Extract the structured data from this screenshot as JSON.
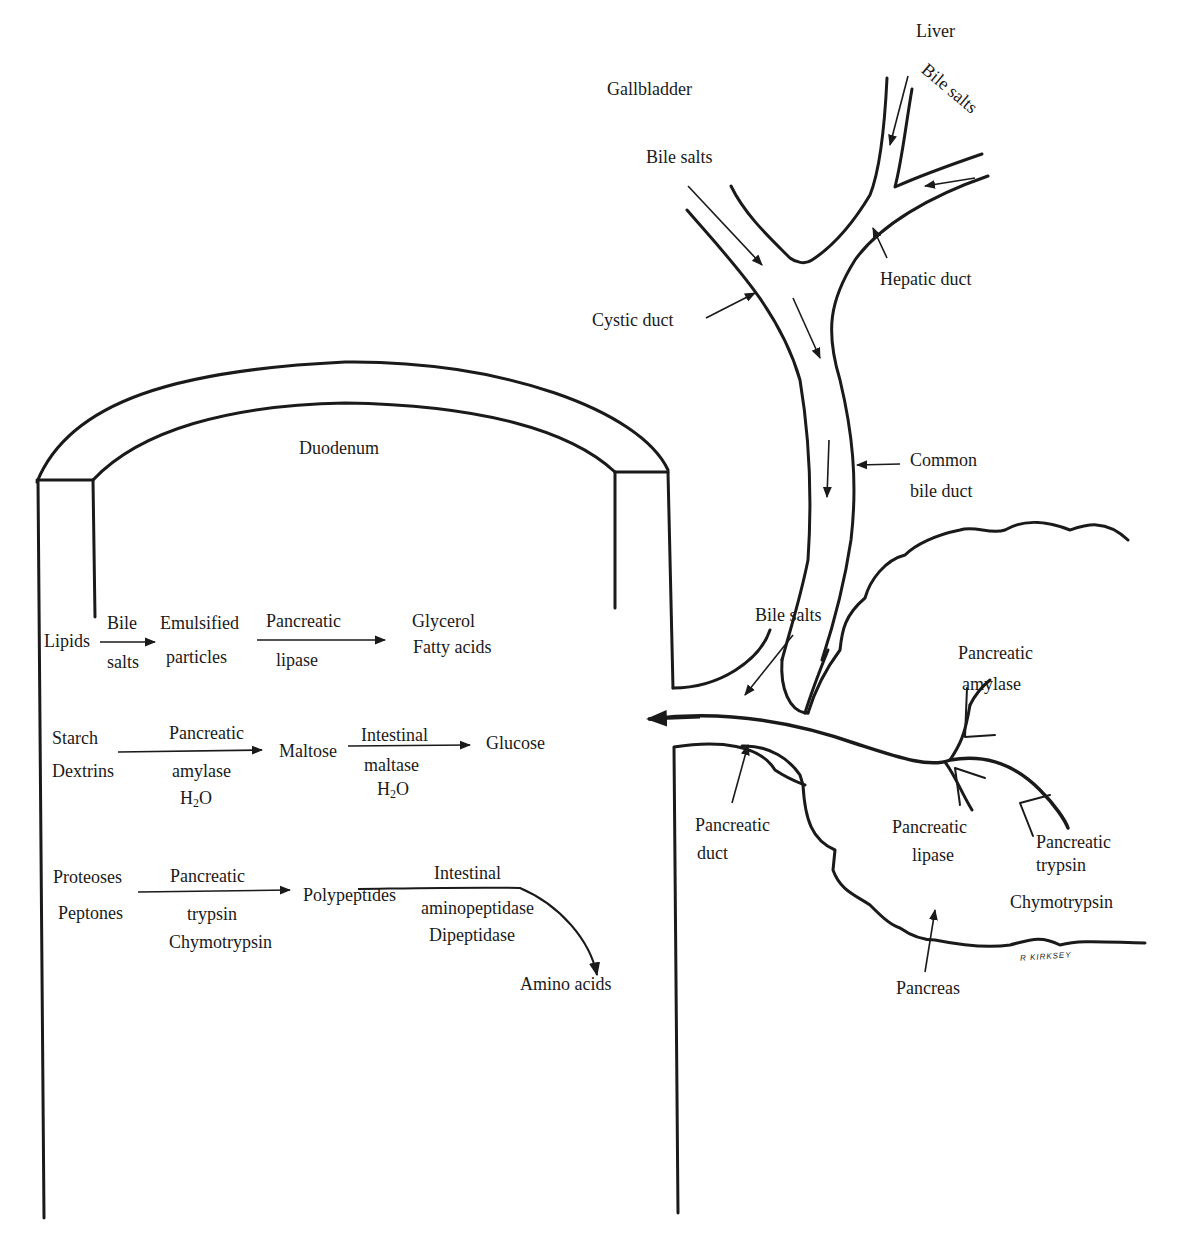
{
  "anatomy": {
    "liver": "Liver",
    "gallbladder": "Gallbladder",
    "bile_salts_liver": "Bile salts",
    "bile_salts_gallbladder": "Bile salts",
    "hepatic_duct": "Hepatic duct",
    "cystic_duct": "Cystic duct",
    "common_bile_duct_1": "Common",
    "common_bile_duct_2": "bile duct",
    "duodenum": "Duodenum",
    "bile_salts_entry": "Bile salts",
    "pancreatic_duct_1": "Pancreatic",
    "pancreatic_duct_2": "duct",
    "pancreas": "Pancreas",
    "amylase_1": "Pancreatic",
    "amylase_2": "amylase",
    "lipase_1": "Pancreatic",
    "lipase_2": "lipase",
    "trypsin_1": "Pancreatic",
    "trypsin_2": "trypsin",
    "chymotrypsin": "Chymotrypsin",
    "signature": "R KIRKSEY"
  },
  "reactions": {
    "lipids": {
      "substrate": "Lipids",
      "agent_top": "Bile",
      "agent_bottom": "salts",
      "intermediate_1": "Emulsified",
      "intermediate_2": "particles",
      "enzyme_top": "Pancreatic",
      "enzyme_bottom": "lipase",
      "product_1": "Glycerol",
      "product_2": "Fatty acids"
    },
    "starch": {
      "substrate_1": "Starch",
      "substrate_2": "Dextrins",
      "enzyme_top": "Pancreatic",
      "enzyme_bottom": "amylase",
      "cofactor_1": "H",
      "cofactor_1_sub": "2",
      "cofactor_1_rest": "O",
      "intermediate": "Maltose",
      "enzyme2_top": "Intestinal",
      "enzyme2_bottom": "maltase",
      "cofactor_2": "H",
      "cofactor_2_sub": "2",
      "cofactor_2_rest": "O",
      "product": "Glucose"
    },
    "protein": {
      "substrate_1": "Proteoses",
      "substrate_2": "Peptones",
      "enzyme_top": "Pancreatic",
      "enzyme_bottom_1": "trypsin",
      "enzyme_bottom_2": "Chymotrypsin",
      "intermediate": "Polypeptides",
      "enzyme2_top": "Intestinal",
      "enzyme2_bottom_1": "aminopeptidase",
      "enzyme2_bottom_2": "Dipeptidase",
      "product": "Amino acids"
    }
  },
  "colors": {
    "ink": "#1a1a1a",
    "background": "#ffffff"
  }
}
